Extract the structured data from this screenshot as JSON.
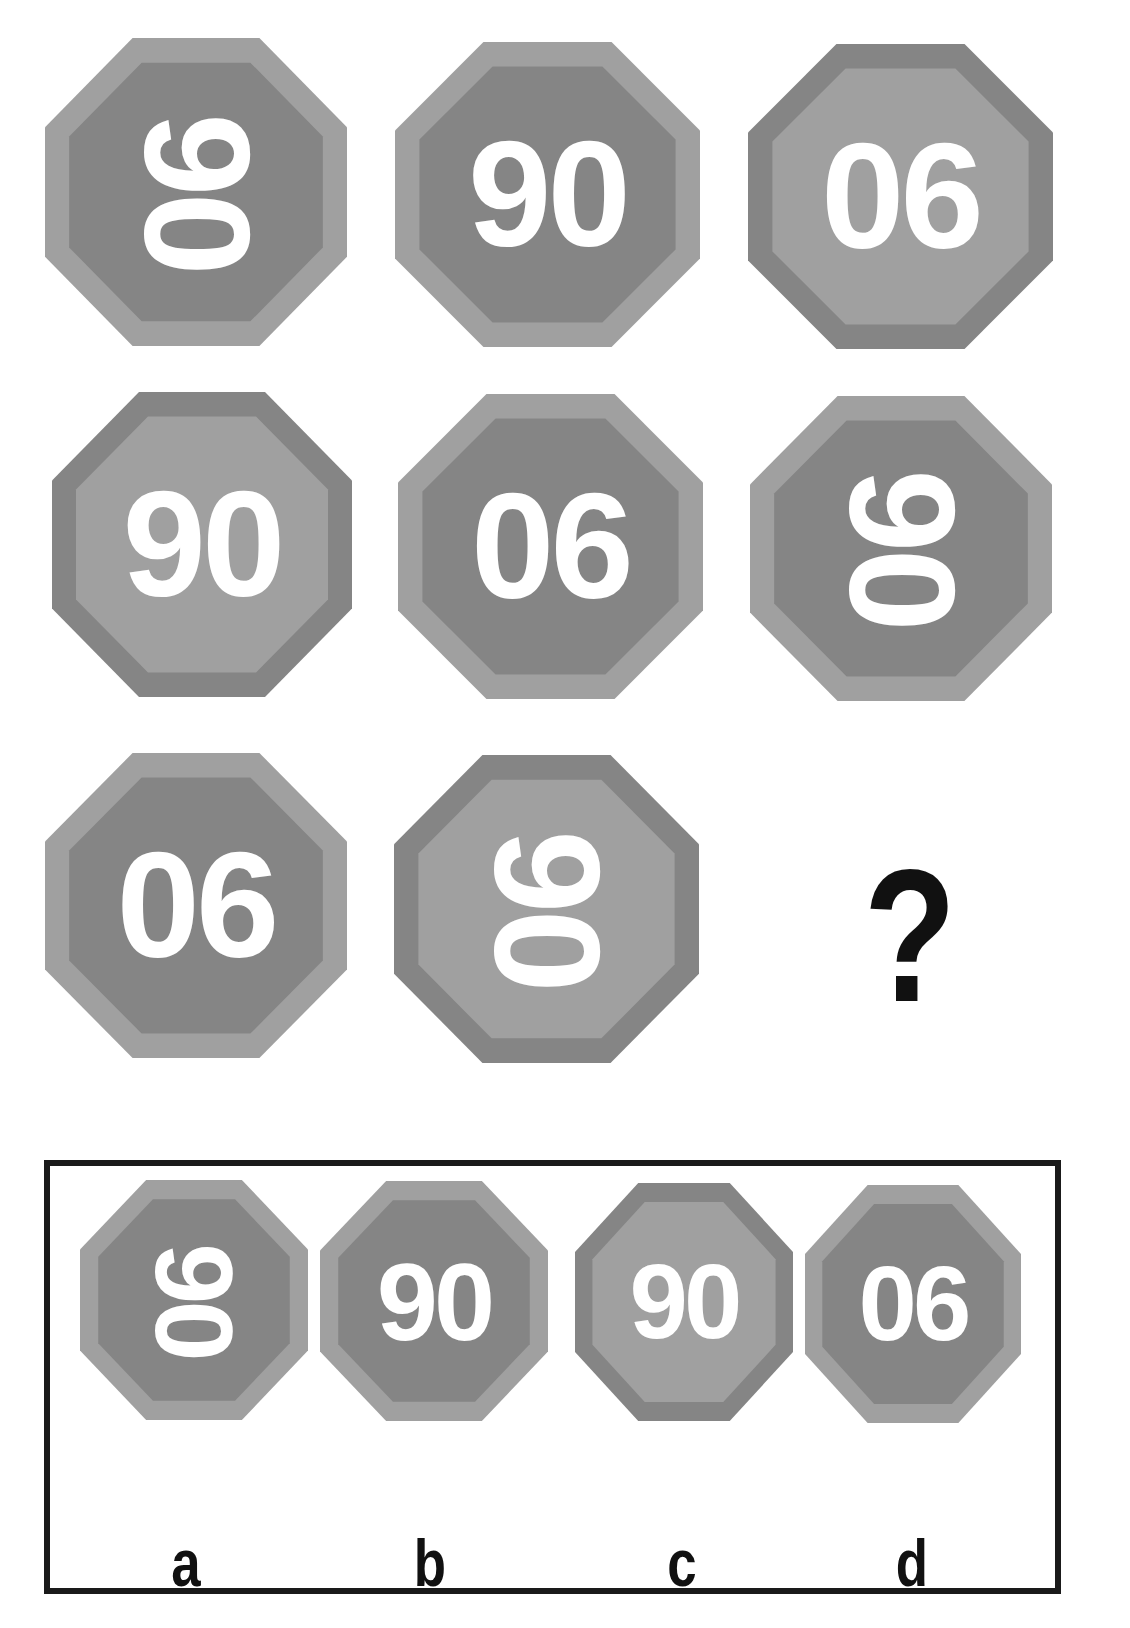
{
  "colors": {
    "light": "#a0a0a0",
    "dark": "#858585",
    "text": "#ffffff",
    "question": "#111111"
  },
  "grid": [
    {
      "row": 1,
      "col": 1,
      "text": "90",
      "rotated": true,
      "outer": "light",
      "inner": "dark"
    },
    {
      "row": 1,
      "col": 2,
      "text": "90",
      "rotated": false,
      "outer": "light",
      "inner": "dark"
    },
    {
      "row": 1,
      "col": 3,
      "text": "06",
      "rotated": false,
      "outer": "dark",
      "inner": "light"
    },
    {
      "row": 2,
      "col": 1,
      "text": "90",
      "rotated": false,
      "outer": "dark",
      "inner": "light"
    },
    {
      "row": 2,
      "col": 2,
      "text": "06",
      "rotated": false,
      "outer": "light",
      "inner": "dark"
    },
    {
      "row": 2,
      "col": 3,
      "text": "90",
      "rotated": true,
      "outer": "light",
      "inner": "dark"
    },
    {
      "row": 3,
      "col": 1,
      "text": "06",
      "rotated": false,
      "outer": "light",
      "inner": "dark"
    },
    {
      "row": 3,
      "col": 2,
      "text": "90",
      "rotated": true,
      "outer": "dark",
      "inner": "light"
    }
  ],
  "question_mark": "?",
  "options": [
    {
      "letter": "a",
      "text": "90",
      "rotated": true,
      "outer": "light",
      "inner": "dark"
    },
    {
      "letter": "b",
      "text": "90",
      "rotated": false,
      "outer": "light",
      "inner": "dark"
    },
    {
      "letter": "c",
      "text": "90",
      "rotated": false,
      "outer": "dark",
      "inner": "light"
    },
    {
      "letter": "d",
      "text": "06",
      "rotated": false,
      "outer": "light",
      "inner": "dark"
    }
  ]
}
